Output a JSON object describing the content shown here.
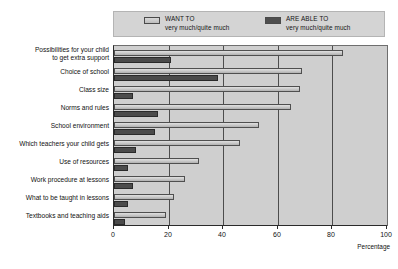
{
  "chart_data": {
    "type": "bar",
    "orientation": "horizontal",
    "title": "",
    "xlabel": "Percentage",
    "ylabel": "",
    "xlim": [
      0,
      100
    ],
    "xticks": [
      0,
      20,
      40,
      60,
      80,
      100
    ],
    "grid": "vertical",
    "legend_position": "top",
    "categories": [
      "Possibilities for your child\nto get extra support",
      "Choice of school",
      "Class size",
      "Norms and rules",
      "School environment",
      "Which teachers your child gets",
      "Use of resources",
      "Work procedure at lessons",
      "What to be taught in lessons",
      "Textbooks and teaching aids"
    ],
    "series": [
      {
        "name": "WANT TO",
        "sublabel": "very much/quite much",
        "color": "#cccccc",
        "values": [
          84,
          69,
          68,
          65,
          53,
          46,
          31,
          26,
          22,
          19
        ]
      },
      {
        "name": "ARE ABLE TO",
        "sublabel": "very much/quite much",
        "color": "#4b4b4b",
        "values": [
          21,
          38,
          7,
          16,
          15,
          8,
          5,
          7,
          5,
          4
        ]
      }
    ]
  },
  "legend": {
    "entries": [
      {
        "label": "WANT TO",
        "sublabel": "very much/quite much",
        "swatch": "light"
      },
      {
        "label": "ARE ABLE TO",
        "sublabel": "very much/quite much",
        "swatch": "dark"
      }
    ]
  },
  "categories": [
    {
      "line1": "Possibilities for your child",
      "line2": "to get extra support"
    },
    {
      "line1": "Choice of school",
      "line2": ""
    },
    {
      "line1": "Class size",
      "line2": ""
    },
    {
      "line1": "Norms and rules",
      "line2": ""
    },
    {
      "line1": "School environment",
      "line2": ""
    },
    {
      "line1": "Which teachers your child gets",
      "line2": ""
    },
    {
      "line1": "Use of resources",
      "line2": ""
    },
    {
      "line1": "Work procedure at lessons",
      "line2": ""
    },
    {
      "line1": "What to be taught in lessons",
      "line2": ""
    },
    {
      "line1": "Textbooks and teaching aids",
      "line2": ""
    }
  ],
  "axis": {
    "ticks": [
      "0",
      "20",
      "40",
      "60",
      "80",
      "100"
    ],
    "title": "Percentage"
  }
}
